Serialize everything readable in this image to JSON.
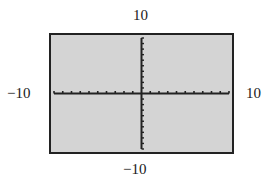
{
  "chart_data": {
    "type": "line",
    "title": "",
    "xlabel": "",
    "ylabel": "",
    "xlim": [
      -10,
      10
    ],
    "ylim": [
      -10,
      10
    ],
    "xscl": 1,
    "yscl": 1,
    "grid": false,
    "series": [],
    "labels": {
      "xmin": "−10",
      "xmax": "10",
      "ymin": "−10",
      "ymax": "10"
    },
    "colors": {
      "screen_background": "#d4d4d4",
      "axes": "#222222",
      "frame": "#222222"
    }
  }
}
